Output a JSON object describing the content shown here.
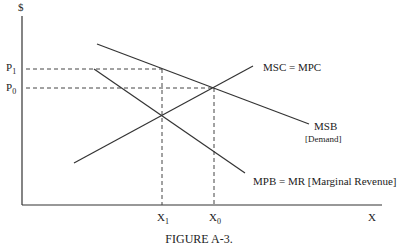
{
  "figure": {
    "caption": "FIGURE A-3.",
    "y_axis_label": "$",
    "x_axis_label": "X",
    "price_labels": [
      {
        "main": "P",
        "sub": "1"
      },
      {
        "main": "P",
        "sub": "0"
      }
    ],
    "quantity_labels": [
      {
        "main": "X",
        "sub": "1"
      },
      {
        "main": "X",
        "sub": "0"
      }
    ],
    "curves": {
      "msc": {
        "label": "MSC = MPC"
      },
      "msb": {
        "label": "MSB",
        "sublabel": "[Demand]"
      },
      "mpb": {
        "label": "MPB = MR [Marginal Revenue]"
      }
    }
  }
}
